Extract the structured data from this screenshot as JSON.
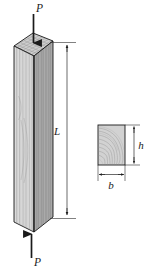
{
  "figure": {
    "labels": {
      "load_top": "P",
      "load_bottom": "P",
      "length": "L",
      "width": "b",
      "height": "h"
    },
    "colors": {
      "outline": "#1a1a1a",
      "front_face": "#d9d9d9",
      "side_face": "#a8a8a8",
      "top_face": "#c8c8c8",
      "section_fill": "#cfcfcf",
      "grain": "#8a8a8a",
      "dimension_line": "#2b2b2b",
      "background": "#ffffff"
    },
    "parts": {
      "column": "wood-column",
      "cross_section": "cross-section-rectangle",
      "arrow_top": "load-arrow-down",
      "arrow_bottom": "load-arrow-up",
      "dimension_length": "length-dimension-line",
      "dimension_width": "width-dimension-line",
      "dimension_height": "height-dimension-line"
    }
  }
}
